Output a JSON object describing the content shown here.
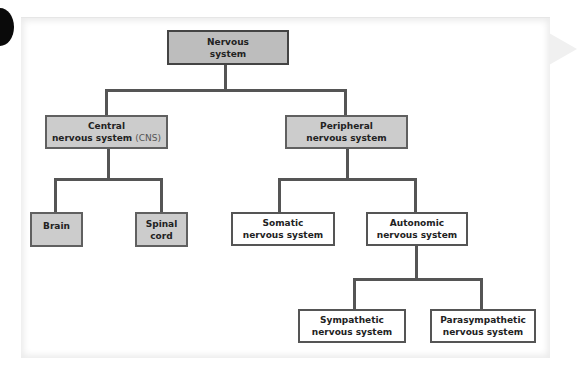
{
  "diagram": {
    "type": "hierarchy",
    "title": "Nervous system",
    "colors": {
      "shaded_box": "#cccccc",
      "root_box": "#bdbdbd",
      "plain_box": "#ffffff",
      "connector": "#555555"
    },
    "nodes": {
      "root": {
        "line1": "Nervous",
        "line2": "system"
      },
      "cns": {
        "line1": "Central",
        "line2": "nervous system",
        "abbr": "(CNS)"
      },
      "pns": {
        "line1": "Peripheral",
        "line2": "nervous system"
      },
      "brain": {
        "line1": "Brain"
      },
      "spinal": {
        "line1": "Spinal",
        "line2": "cord"
      },
      "somatic": {
        "line1": "Somatic",
        "line2": "nervous system"
      },
      "autonomic": {
        "line1": "Autonomic",
        "line2": "nervous system"
      },
      "sympathetic": {
        "line1": "Sympathetic",
        "line2": "nervous system"
      },
      "parasympathetic": {
        "line1": "Parasympathetic",
        "line2": "nervous system"
      }
    },
    "edges": [
      [
        "root",
        "cns"
      ],
      [
        "root",
        "pns"
      ],
      [
        "cns",
        "brain"
      ],
      [
        "cns",
        "spinal"
      ],
      [
        "pns",
        "somatic"
      ],
      [
        "pns",
        "autonomic"
      ],
      [
        "autonomic",
        "sympathetic"
      ],
      [
        "autonomic",
        "parasympathetic"
      ]
    ]
  }
}
